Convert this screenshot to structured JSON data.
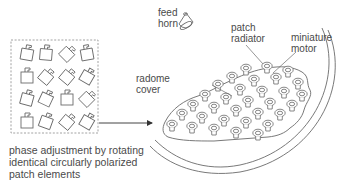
{
  "labels": {
    "feed_horn": "feed\nhorn",
    "patch_radiator": "patch\nradiator",
    "miniature_motor": "miniature\nmotor",
    "radome_cover": "radome\ncover"
  },
  "caption": {
    "line1": "phase adjustment by rotating",
    "line2": "identical circularly polarized",
    "line3": "patch elements"
  },
  "colors": {
    "line": "#6a6a6a",
    "text": "#4a4a4a",
    "dash_box": "#8a8a8a"
  },
  "patch_grid": {
    "rows": 4,
    "cols": 4,
    "rotations_deg": [
      [
        10,
        5,
        45,
        -10
      ],
      [
        0,
        40,
        40,
        30
      ],
      [
        15,
        25,
        0,
        45
      ],
      [
        0,
        20,
        40,
        30
      ]
    ]
  }
}
